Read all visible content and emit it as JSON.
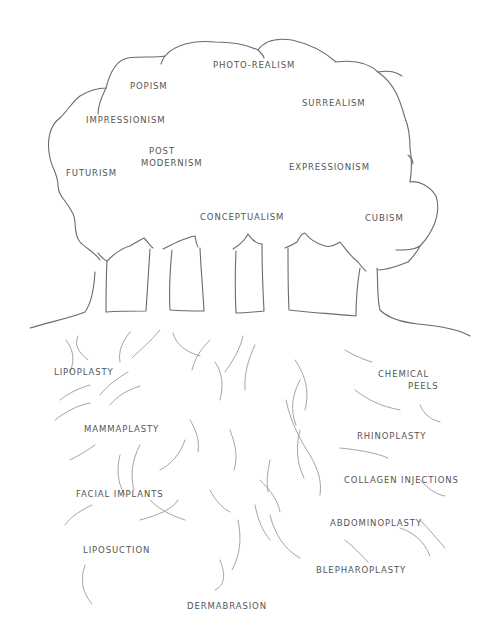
{
  "diagram": {
    "type": "hand-drawn tree metaphor",
    "canopy": {
      "labels": [
        {
          "text": "PHOTO-REALISM",
          "x": 213,
          "y": 60
        },
        {
          "text": "POPISM",
          "x": 130,
          "y": 81
        },
        {
          "text": "SURREALISM",
          "x": 302,
          "y": 98
        },
        {
          "text": "IMPRESSIONISM",
          "x": 86,
          "y": 115
        },
        {
          "text": "POST",
          "x": 149,
          "y": 146
        },
        {
          "text": "MODERNISM",
          "x": 141,
          "y": 158
        },
        {
          "text": "FUTURISM",
          "x": 66,
          "y": 168
        },
        {
          "text": "EXPRESSIONISM",
          "x": 289,
          "y": 162
        },
        {
          "text": "CONCEPTUALISM",
          "x": 200,
          "y": 212
        },
        {
          "text": "CUBISM",
          "x": 365,
          "y": 213
        }
      ]
    },
    "roots": {
      "labels": [
        {
          "text": "LIPOPLASTY",
          "x": 54,
          "y": 367
        },
        {
          "text": "CHEMICAL",
          "x": 378,
          "y": 369
        },
        {
          "text": "PEELS",
          "x": 408,
          "y": 381
        },
        {
          "text": "MAMMAPLASTY",
          "x": 84,
          "y": 424
        },
        {
          "text": "RHINOPLASTY",
          "x": 357,
          "y": 431
        },
        {
          "text": "COLLAGEN INJECTIONS",
          "x": 344,
          "y": 475
        },
        {
          "text": "FACIAL IMPLANTS",
          "x": 76,
          "y": 489
        },
        {
          "text": "ABDOMINOPLASTY",
          "x": 330,
          "y": 518
        },
        {
          "text": "LIPOSUCTION",
          "x": 83,
          "y": 545
        },
        {
          "text": "BLEPHAROPLASTY",
          "x": 316,
          "y": 565
        },
        {
          "text": "DERMABRASION",
          "x": 187,
          "y": 601
        }
      ]
    }
  }
}
